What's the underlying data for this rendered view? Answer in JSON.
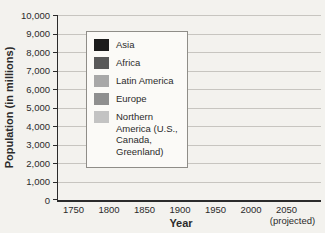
{
  "chart_data": {
    "type": "bar",
    "stacked": true,
    "xlabel": "Year",
    "ylabel": "Population (in millions)",
    "ylim": [
      0,
      10000
    ],
    "ytick_step": 1000,
    "ytick_labels": [
      "0",
      "1,000",
      "2,000",
      "3,000",
      "4,000",
      "5,000",
      "6,000",
      "7,000",
      "8,000",
      "9,000",
      "10,000"
    ],
    "categories": [
      "1750",
      "1800",
      "1850",
      "1900",
      "1950",
      "2000",
      "2050"
    ],
    "x_annotation": "(projected)",
    "x_annotation_category": "2050",
    "grid": true,
    "legend_position": "upper-left-inside",
    "series": [
      {
        "name": "Asia",
        "color": "#1c1c1c",
        "values": [
          500,
          635,
          810,
          950,
          1400,
          3700,
          5270
        ]
      },
      {
        "name": "Africa",
        "color": "#595959",
        "values": [
          105,
          107,
          111,
          133,
          220,
          800,
          2480
        ]
      },
      {
        "name": "Latin America",
        "color": "#a8a8a8",
        "values": [
          16,
          24,
          38,
          74,
          167,
          520,
          780
        ]
      },
      {
        "name": "Europe",
        "color": "#8f8f8f",
        "values": [
          163,
          203,
          276,
          408,
          547,
          730,
          710
        ]
      },
      {
        "name": "Northern America (U.S., Canada, Greenland)",
        "color": "#c3c3c3",
        "values": [
          2,
          7,
          26,
          82,
          172,
          315,
          430
        ]
      }
    ],
    "totals_approx": [
      786,
      976,
      1261,
      1647,
      2506,
      6065,
      9670
    ]
  },
  "colors": {
    "background": "#f3f2ee",
    "gridline": "#c7c5c0",
    "axis": "#2b2b2b",
    "legend_background": "#fbfaf7",
    "legend_border": "#8f8d88"
  }
}
